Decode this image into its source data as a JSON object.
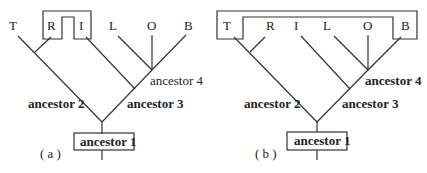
{
  "panels": [
    {
      "caption": "( a )",
      "leaves": [
        "T",
        "R",
        "I",
        "L",
        "O",
        "B"
      ],
      "ancestors": {
        "a1": "ancestor 1",
        "a2": "ancestor 2",
        "a3": "ancestor 3",
        "a4": "ancestor 4"
      },
      "grouped_leaves": [
        "R",
        "I"
      ]
    },
    {
      "caption": "( b )",
      "leaves": [
        "T",
        "R",
        "I",
        "L",
        "O",
        "B"
      ],
      "ancestors": {
        "a1": "ancestor 1",
        "a2": "ancestor 2",
        "a3": "ancestor 3",
        "a4": "ancestor 4"
      },
      "grouped_leaves": [
        "T",
        "B"
      ]
    }
  ]
}
